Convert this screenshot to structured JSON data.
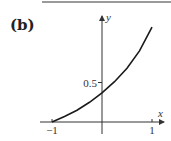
{
  "panel": {
    "label": "(b)"
  },
  "chart_data": {
    "type": "line",
    "title": "",
    "xlabel": "x",
    "ylabel": "y",
    "xlim": [
      -1.1,
      1.2
    ],
    "ylim": [
      0,
      1.25
    ],
    "grid": false,
    "x_ticks": [
      {
        "value": -1,
        "label": "-1"
      },
      {
        "value": 1,
        "label": "1"
      }
    ],
    "y_ticks": [
      {
        "value": 0.5,
        "label": "0.5"
      }
    ],
    "series": [
      {
        "name": "curve",
        "x": [
          -1,
          -0.75,
          -0.5,
          -0.25,
          0,
          0.25,
          0.5,
          0.75,
          1
        ],
        "y": [
          0,
          0.07,
          0.15,
          0.25,
          0.37,
          0.51,
          0.68,
          0.9,
          1.2
        ]
      }
    ]
  }
}
